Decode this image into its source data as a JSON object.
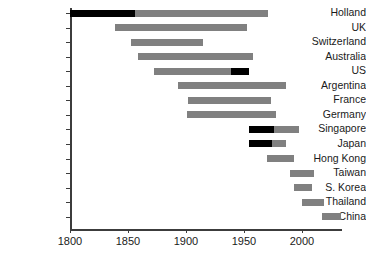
{
  "chart_data": {
    "type": "bar",
    "orientation": "horizontal",
    "subtype": "gantt-range",
    "title": "",
    "xlabel": "",
    "ylabel": "",
    "xlim": [
      1800,
      2010
    ],
    "grid": false,
    "legend": null,
    "xticks": [
      1800,
      1850,
      1900,
      1950,
      2000
    ],
    "xticklabels": [
      "1800",
      "1850",
      "1900",
      "1950",
      "2000"
    ],
    "categories": [
      "Holland",
      "UK",
      "Switzerland",
      "Australia",
      "US",
      "Argentina",
      "France",
      "Germany",
      "Singapore",
      "Japan",
      "Hong Kong",
      "Taiwan",
      "S. Korea",
      "Thailand",
      "China"
    ],
    "colors": {
      "primary": "#808080",
      "highlight": "#000000",
      "axis": "#3c3c3c",
      "text": "#1a1a1a"
    },
    "segments": [
      {
        "category": "Holland",
        "spans": [
          {
            "start": 1800,
            "end": 1856,
            "color": "#000000"
          },
          {
            "start": 1856,
            "end": 1971,
            "color": "#808080"
          }
        ]
      },
      {
        "category": "UK",
        "spans": [
          {
            "start": 1839,
            "end": 1953,
            "color": "#808080"
          }
        ]
      },
      {
        "category": "Switzerland",
        "spans": [
          {
            "start": 1853,
            "end": 1915,
            "color": "#808080"
          }
        ]
      },
      {
        "category": "Australia",
        "spans": [
          {
            "start": 1859,
            "end": 1958,
            "color": "#808080"
          }
        ]
      },
      {
        "category": "US",
        "spans": [
          {
            "start": 1872,
            "end": 1939,
            "color": "#808080"
          },
          {
            "start": 1939,
            "end": 1954,
            "color": "#000000"
          }
        ]
      },
      {
        "category": "Argentina",
        "spans": [
          {
            "start": 1893,
            "end": 1986,
            "color": "#808080"
          }
        ]
      },
      {
        "category": "France",
        "spans": [
          {
            "start": 1902,
            "end": 1973,
            "color": "#808080"
          }
        ]
      },
      {
        "category": "Germany",
        "spans": [
          {
            "start": 1901,
            "end": 1978,
            "color": "#808080"
          }
        ]
      },
      {
        "category": "Singapore",
        "spans": [
          {
            "start": 1954,
            "end": 1976,
            "color": "#000000"
          },
          {
            "start": 1976,
            "end": 1997,
            "color": "#808080"
          }
        ]
      },
      {
        "category": "Japan",
        "spans": [
          {
            "start": 1954,
            "end": 1974,
            "color": "#000000"
          },
          {
            "start": 1974,
            "end": 1986,
            "color": "#808080"
          }
        ]
      },
      {
        "category": "Hong Kong",
        "spans": [
          {
            "start": 1970,
            "end": 1993,
            "color": "#808080"
          }
        ]
      },
      {
        "category": "Taiwan",
        "spans": [
          {
            "start": 1990,
            "end": 2010,
            "color": "#808080"
          }
        ]
      },
      {
        "category": "S. Korea",
        "spans": [
          {
            "start": 1993,
            "end": 2009,
            "color": "#808080"
          }
        ]
      },
      {
        "category": "Thailand",
        "spans": [
          {
            "start": 2000,
            "end": 2019,
            "color": "#808080"
          }
        ]
      },
      {
        "category": "China",
        "spans": [
          {
            "start": 2017,
            "end": 2034,
            "color": "#808080"
          }
        ]
      }
    ]
  }
}
